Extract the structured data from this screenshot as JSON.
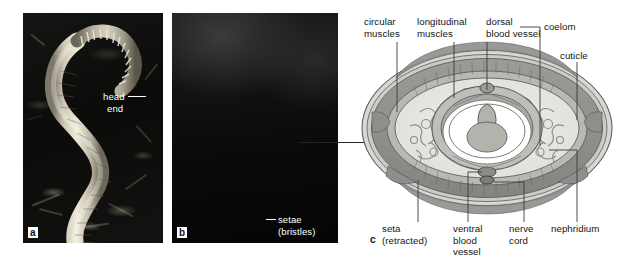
{
  "figure": {
    "background_color": "#ffffff",
    "panels": [
      {
        "letter": "a",
        "type": "photograph",
        "caption": "Earthworm on soil surface"
      },
      {
        "letter": "b",
        "type": "scanning-electron-micrograph",
        "caption": "Head end with setae"
      },
      {
        "letter": "c",
        "type": "diagram",
        "caption": "Transverse section through body"
      }
    ]
  },
  "panel_a": {
    "letter": "a",
    "labels": [
      {
        "name": "head-end",
        "line1": "head",
        "line2": "end"
      }
    ]
  },
  "panel_b": {
    "letter": "b",
    "labels": [
      {
        "name": "setae",
        "line1": "setae",
        "line2": "(bristles)"
      }
    ]
  },
  "panel_c": {
    "letter": "c",
    "labels_top": [
      {
        "name": "circular-muscles",
        "line1": "circular",
        "line2": "muscles"
      },
      {
        "name": "longitudinal-muscles",
        "line1": "longitudinal",
        "line2": "muscles"
      },
      {
        "name": "dorsal-blood-vessel",
        "line1": "dorsal",
        "line2": "blood vessel"
      }
    ],
    "labels_right": [
      {
        "name": "coelom",
        "text": "coelom"
      },
      {
        "name": "cuticle",
        "text": "cuticle"
      }
    ],
    "labels_bottom": [
      {
        "name": "seta",
        "line1": "seta",
        "line2": "(retracted)",
        "line3": ""
      },
      {
        "name": "ventral-blood-vessel",
        "line1": "ventral",
        "line2": "blood",
        "line3": "vessel"
      },
      {
        "name": "nerve-cord",
        "line1": "nerve",
        "line2": "cord",
        "line3": ""
      },
      {
        "name": "nephridium",
        "line1": "nephridium",
        "line2": "",
        "line3": ""
      }
    ]
  },
  "colors": {
    "page_background": "#ffffff",
    "text": "#141414",
    "leader_line": "#3a3a3a",
    "diagram_outline": "#6b6b6b",
    "diagram_muscle_fill": "#9a9a9a",
    "diagram_coelom_fill": "#e4e4e2",
    "diagram_gut_fill": "#b6b6b4",
    "photo_label_text": "#ffffff"
  }
}
